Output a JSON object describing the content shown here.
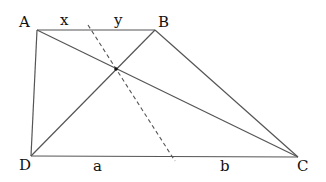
{
  "figure": {
    "type": "trapezoid-diagram",
    "vertices": {
      "A": {
        "label": "A",
        "x": 37,
        "y": 30
      },
      "B": {
        "label": "B",
        "x": 155,
        "y": 30
      },
      "C": {
        "label": "C",
        "x": 298,
        "y": 157
      },
      "D": {
        "label": "D",
        "x": 31,
        "y": 156
      }
    },
    "intersection": {
      "x": 116,
      "y": 69
    },
    "dashed_line": {
      "x1": 88,
      "y1": 25,
      "x2": 175,
      "y2": 161
    },
    "segment_labels": {
      "x": "x",
      "y": "y",
      "a": "a",
      "b": "b"
    },
    "colors": {
      "line": "#555555",
      "dash": "#555555",
      "text": "#111111"
    }
  }
}
